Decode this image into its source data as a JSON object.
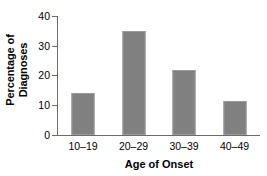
{
  "chart_data": {
    "type": "bar",
    "title": "",
    "subtitle": "",
    "xlabel": "Age of Onset",
    "ylabel": "Percentage of Diagnoses",
    "ylabel_line1": "Percentage of",
    "ylabel_line2": "Diagnoses",
    "categories": [
      "10–19",
      "20–29",
      "30–39",
      "40–49"
    ],
    "values": [
      14,
      35,
      22,
      11.5
    ],
    "ylim": [
      0,
      40
    ],
    "yticks": [
      0,
      10,
      20,
      30,
      40
    ],
    "ytick_labels": [
      "0",
      "10",
      "20",
      "30",
      "40"
    ],
    "grid": false,
    "legend": false,
    "legend_position": "none",
    "bar_color": "#808080",
    "bar_edge_color": "#9a9a9a",
    "axis_color": "#6b6b6b",
    "background_color": "#ffffff",
    "text_color": "#000000"
  }
}
